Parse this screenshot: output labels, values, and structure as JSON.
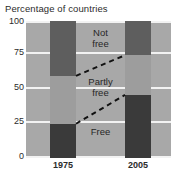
{
  "chart_data": {
    "type": "bar",
    "title": "Percentage of countries",
    "xlabel": "",
    "ylabel": "",
    "ylim": [
      0,
      100
    ],
    "yticks": [
      0,
      25,
      50,
      75,
      100
    ],
    "grid": true,
    "legend": "in-plot labels",
    "stacked": true,
    "categories": [
      "1975",
      "2005"
    ],
    "series": [
      {
        "name": "Free",
        "values": [
          25,
          46
        ],
        "color": "#3a3a3a"
      },
      {
        "name": "Partly free",
        "values": [
          35,
          29
        ],
        "color": "#9d9d9d"
      },
      {
        "name": "Not free",
        "values": [
          40,
          25
        ],
        "color": "#5e5e5e"
      }
    ],
    "segment_boundaries": {
      "1975": {
        "free_top": 25,
        "partly_top": 60
      },
      "2005": {
        "free_top": 46,
        "partly_top": 75
      }
    },
    "annotations": [
      {
        "text": "Not free",
        "x": 0.5,
        "y": 88
      },
      {
        "text": "Partly free",
        "x": 0.5,
        "y": 55
      },
      {
        "text": "Free",
        "x": 0.5,
        "y": 15
      }
    ]
  },
  "chart": {
    "title": "Percentage of countries",
    "y_ticks": [
      "100",
      "75",
      "50",
      "25",
      "0"
    ],
    "x_ticks": [
      "1975",
      "2005"
    ],
    "labels": {
      "not_free": "Not\nfree",
      "partly_free": "Partly\nfree",
      "free": "Free"
    },
    "colors": {
      "plot_background": "#a8a8a8",
      "gridline": "#f2f2f2",
      "not_free": "#5e5e5e",
      "partly_free": "#9d9d9d",
      "free": "#3a3a3a",
      "connector": "#111111",
      "text": "#2b2b2b"
    }
  }
}
